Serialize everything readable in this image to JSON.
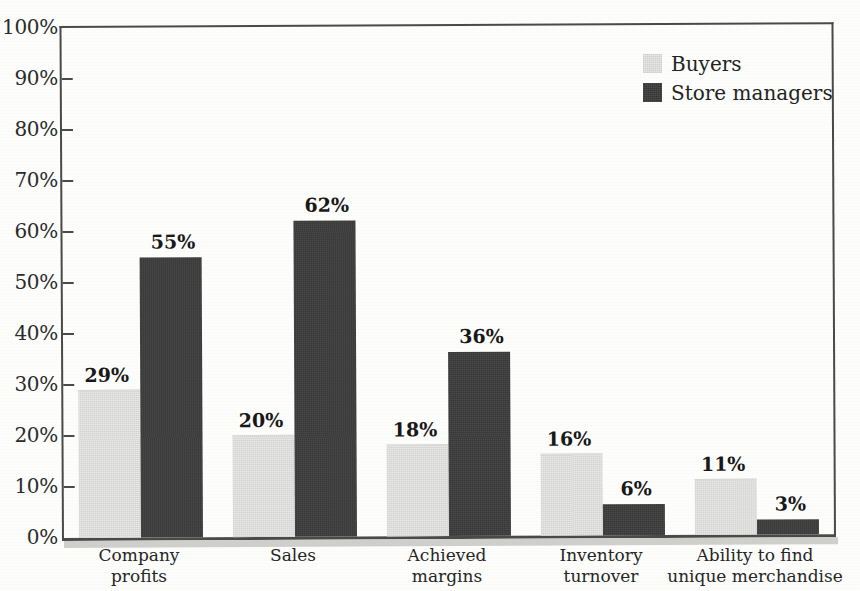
{
  "chart_data": {
    "type": "bar",
    "title": "",
    "subtitle": "",
    "xlabel": "",
    "ylabel": "",
    "ylim": [
      0,
      100
    ],
    "grid": false,
    "legend_position": "top-right",
    "categories": [
      "Company\nprofits",
      "Sales",
      "Achieved\nmargins",
      "Inventory\nturnover",
      "Ability to find\nunique merchandise"
    ],
    "series": [
      {
        "name": "Buyers",
        "color": "#e9e9e7",
        "values": [
          29,
          20,
          18,
          16,
          11
        ],
        "value_labels": [
          "29%",
          "20%",
          "18%",
          "16%",
          "11%"
        ]
      },
      {
        "name": "Store managers",
        "color": "#373737",
        "values": [
          55,
          62,
          36,
          6,
          3
        ],
        "value_labels": [
          "55%",
          "62%",
          "36%",
          "6%",
          "3%"
        ]
      }
    ],
    "y_ticks": [
      0,
      10,
      20,
      30,
      40,
      50,
      60,
      70,
      80,
      90,
      100
    ],
    "y_tick_labels": [
      "0%",
      "10%",
      "20%",
      "30%",
      "40%",
      "50%",
      "60%",
      "70%",
      "80%",
      "90%",
      "100%"
    ]
  },
  "legend": {
    "items": [
      {
        "label": "Buyers",
        "swatch": "sw-buyers"
      },
      {
        "label": "Store managers",
        "swatch": "sw-managers"
      }
    ]
  },
  "colors": {
    "buyers": "#e9e9e7",
    "store_managers": "#373737",
    "axis": "#4a4a4a",
    "text": "#262626",
    "background": "#fdfdfb"
  }
}
